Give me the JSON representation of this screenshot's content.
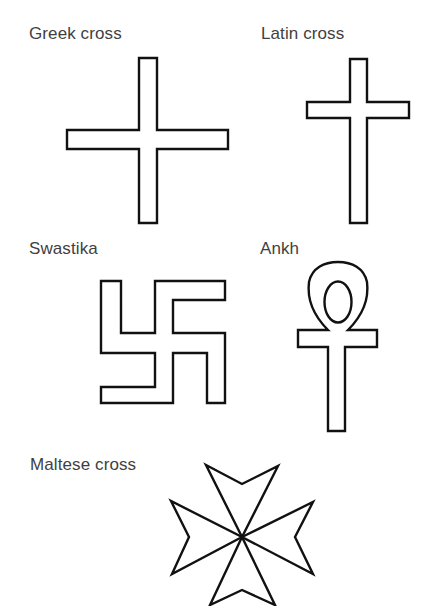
{
  "diagram": {
    "background": "#ffffff",
    "stroke_color": "#111111",
    "label_color": "#3f3f3f",
    "symbols": [
      {
        "id": "greek-cross",
        "label": "Greek cross"
      },
      {
        "id": "latin-cross",
        "label": "Latin cross"
      },
      {
        "id": "swastika",
        "label": "Swastika"
      },
      {
        "id": "ankh",
        "label": "Ankh"
      },
      {
        "id": "maltese-cross",
        "label": "Maltese cross"
      }
    ]
  }
}
